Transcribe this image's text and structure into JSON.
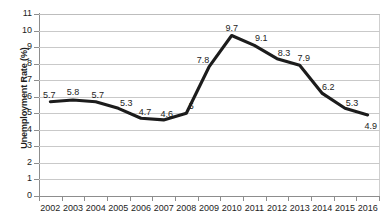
{
  "chart_data": {
    "type": "line",
    "title": "",
    "xlabel": "",
    "ylabel": "Unemployment Rate (%)",
    "categories": [
      "2002",
      "2003",
      "2004",
      "2005",
      "2006",
      "2007",
      "2008",
      "2009",
      "2010",
      "2011",
      "2012",
      "2013",
      "2014",
      "2015",
      "2016"
    ],
    "values": [
      5.7,
      5.8,
      5.7,
      5.3,
      4.7,
      4.6,
      5,
      7.8,
      9.7,
      9.1,
      8.3,
      7.9,
      6.2,
      5.3,
      4.9
    ],
    "value_labels": [
      "5.7",
      "5.8",
      "5.7",
      "5.3",
      "4.7",
      "4.6",
      "5",
      "7.8",
      "9.7",
      "9.1",
      "8.3",
      "7.9",
      "6.2",
      "5.3",
      "4.9"
    ],
    "series": [
      {
        "name": "Unemployment Rate",
        "values": [
          5.7,
          5.8,
          5.7,
          5.3,
          4.7,
          4.6,
          5,
          7.8,
          9.7,
          9.1,
          8.3,
          7.9,
          6.2,
          5.3,
          4.9
        ],
        "color": "#1c1c1c"
      }
    ],
    "ylim": [
      0,
      11
    ],
    "ytick_labels": [
      "0",
      "1",
      "2",
      "3",
      "4",
      "5",
      "6",
      "7",
      "8",
      "9",
      "10",
      "11"
    ],
    "ytick_step": 1,
    "grid": true,
    "grid_color": "#c9c9c9",
    "legend": false,
    "legend_position": "none",
    "data_labels_shown": true,
    "markers": false,
    "background": "#ffffff",
    "line_color": "#1c1c1c"
  },
  "axes": {
    "y_title": "Unemployment Rate (%)",
    "y_ticks": [
      "0",
      "1",
      "2",
      "3",
      "4",
      "5",
      "6",
      "7",
      "8",
      "9",
      "10",
      "11"
    ],
    "x_ticks": [
      "2002",
      "2003",
      "2004",
      "2005",
      "2006",
      "2007",
      "2008",
      "2009",
      "2010",
      "2011",
      "2012",
      "2013",
      "2014",
      "2015",
      "2016"
    ]
  }
}
